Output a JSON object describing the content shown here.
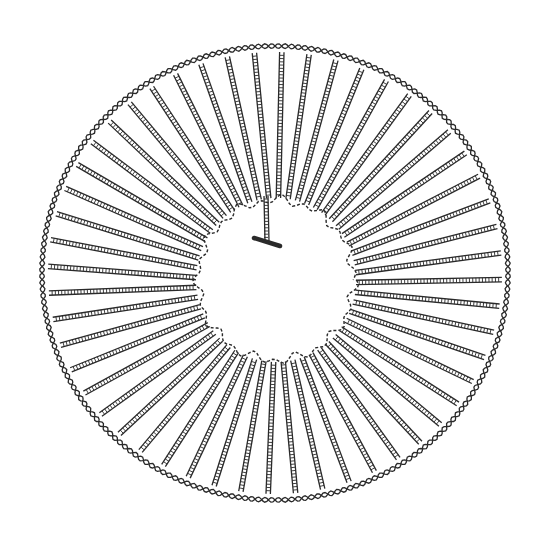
{
  "image": {
    "description": "Black-and-white line drawing of a circular crochet/woven ring: radial chain-stitch spokes between a twisted-cord outer ring and a ragged inner opening, with one short spoke ending in a crossbar inside the opening.",
    "colors": {
      "ink": "#2a2a2a",
      "paper": "#ffffff",
      "stitch_fill": "#ffffff"
    },
    "outer_ring": {
      "cx": 275,
      "cy": 273,
      "rx": 233,
      "ry": 227
    },
    "inner_opening": {
      "cx": 276,
      "cy": 280,
      "rx": 78,
      "ry": 80
    },
    "spoke_count": 52,
    "short_spoke": {
      "x1": 266,
      "y1": 196,
      "x2": 267,
      "y2": 242,
      "bar_x1": 254,
      "bar_y1": 238,
      "bar_x2": 280,
      "bar_y2": 246
    }
  }
}
